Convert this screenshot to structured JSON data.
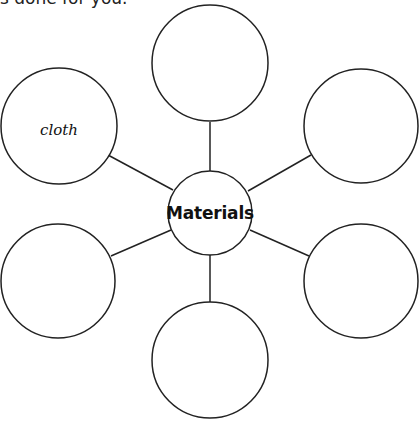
{
  "header": {
    "cropped_text": "s done for you."
  },
  "diagram": {
    "type": "spider-diagram",
    "stroke_color": "#222222",
    "center": {
      "label": "Materials",
      "cx": 210,
      "cy": 213,
      "r": 42
    },
    "nodes": [
      {
        "id": "top",
        "label": "",
        "cx": 210,
        "cy": 63,
        "r": 58
      },
      {
        "id": "top-right",
        "label": "",
        "cx": 361,
        "cy": 126,
        "r": 57
      },
      {
        "id": "bottom-right",
        "label": "",
        "cx": 361,
        "cy": 281,
        "r": 57
      },
      {
        "id": "bottom",
        "label": "",
        "cx": 210,
        "cy": 360,
        "r": 58
      },
      {
        "id": "bottom-left",
        "label": "",
        "cx": 58,
        "cy": 281,
        "r": 57
      },
      {
        "id": "top-left",
        "label": "cloth",
        "cx": 59,
        "cy": 126,
        "r": 58
      }
    ],
    "connectors": [
      {
        "to": "top",
        "x1": 210,
        "y1": 122,
        "x2": 210,
        "y2": 171
      },
      {
        "to": "top-right",
        "x1": 248,
        "y1": 191,
        "x2": 311,
        "y2": 155
      },
      {
        "to": "bottom-right",
        "x1": 250,
        "y1": 230,
        "x2": 309,
        "y2": 256
      },
      {
        "to": "bottom",
        "x1": 210,
        "y1": 255,
        "x2": 210,
        "y2": 302
      },
      {
        "to": "bottom-left",
        "x1": 171,
        "y1": 230,
        "x2": 111,
        "y2": 256
      },
      {
        "to": "top-left",
        "x1": 173,
        "y1": 190,
        "x2": 108,
        "y2": 155
      }
    ]
  }
}
